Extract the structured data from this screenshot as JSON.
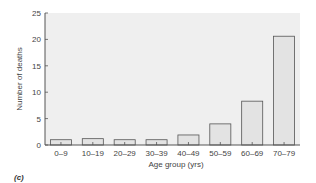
{
  "chart_data": {
    "type": "bar",
    "title": "",
    "xlabel": "Age group (yrs)",
    "ylabel": "Number of deaths",
    "categories": [
      "0–9",
      "10–19",
      "20–29",
      "30–39",
      "40–49",
      "50–59",
      "60–69",
      "70–79"
    ],
    "values": [
      1,
      1.2,
      1,
      1,
      1.9,
      4,
      8.3,
      20.6
    ],
    "ylim": [
      0,
      25
    ],
    "yticks": [
      0,
      5,
      10,
      15,
      20,
      25
    ],
    "grid": false,
    "legend": null,
    "colors": {
      "plot_bg": "#efefef",
      "bar_fill": "#e3e3e3",
      "bar_stroke": "#555555",
      "axis": "#555555"
    }
  },
  "panel_label": "(c)"
}
